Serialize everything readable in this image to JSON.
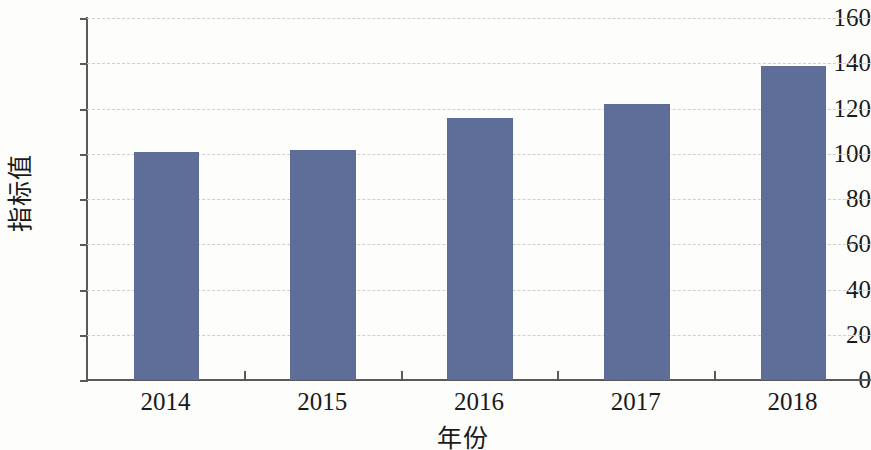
{
  "chart_data": {
    "type": "bar",
    "title": "",
    "subtitle": "",
    "categories": [
      "2014",
      "2015",
      "2016",
      "2017",
      "2018"
    ],
    "values": [
      100,
      101,
      115,
      121,
      138
    ],
    "xlabel": "年份",
    "ylabel": "指标值",
    "ylim": [
      0,
      160
    ],
    "ytick_values": [
      0,
      20,
      40,
      60,
      80,
      100,
      120,
      140,
      160
    ],
    "ytick_labels": [
      "0",
      "20",
      "40",
      "60",
      "80",
      "100",
      "120",
      "140",
      "160"
    ],
    "grid": true,
    "grid_axis": "y",
    "grid_style": "dashed",
    "legend": false,
    "legend_position": "none",
    "series": [
      {
        "name": "指标值",
        "values": [
          100,
          101,
          115,
          121,
          138
        ]
      }
    ],
    "colors": {
      "bar": "#5f6e99",
      "grid": "#cfcfcf",
      "axis": "#5a5a5a",
      "text": "#1a1a1a",
      "background": "#fdfdfb"
    }
  }
}
